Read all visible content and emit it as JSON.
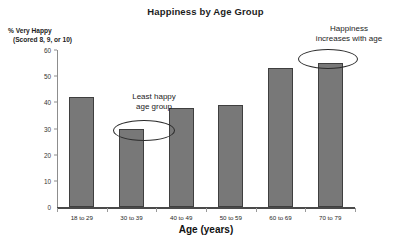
{
  "chart_data": {
    "type": "bar",
    "title": "Happiness by Age Group",
    "xlabel": "Age (years)",
    "ylabel": "% Very Happy (Scored 8, 9, or 10)",
    "ylabel_line1": "% Very Happy",
    "ylabel_line2": "(Scored 8, 9, or 10)",
    "categories": [
      "18 to 29",
      "30 to 39",
      "40 to 49",
      "50 to 59",
      "60 to 69",
      "70 to 79"
    ],
    "values": [
      42,
      30,
      38,
      39,
      53,
      55
    ],
    "ylim": [
      0,
      60
    ],
    "yticks": [
      0,
      10,
      20,
      30,
      40,
      50,
      60
    ],
    "ytick_labels": [
      "0",
      "10",
      "20",
      "30",
      "40",
      "50",
      "60"
    ],
    "grid": false,
    "legend": "none",
    "bar_color": "#787878",
    "bar_border_color": "#3f3f3f",
    "background_color": "#ffffff",
    "annotations": [
      {
        "text": "Least happy age group",
        "line1": "Least happy",
        "line2": "age group",
        "target_category": "30 to 39",
        "marker": "ellipse"
      },
      {
        "text": "Happiness increases with age",
        "line1": "Happiness",
        "line2": "increases with age",
        "target_category": "70 to 79",
        "marker": "ellipse"
      }
    ]
  }
}
